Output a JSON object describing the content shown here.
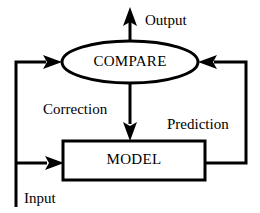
{
  "diagram": {
    "background_color": "#ffffff",
    "stroke_color": "#000000",
    "nodes": [
      {
        "id": "compare",
        "label": "COMPARE",
        "shape": "ellipse",
        "cx": 130,
        "cy": 62,
        "rx": 68,
        "ry": 21
      },
      {
        "id": "model",
        "label": "MODEL",
        "shape": "rectangle",
        "x": 63,
        "y": 141,
        "width": 142,
        "height": 39
      }
    ],
    "edge_labels": [
      {
        "id": "output",
        "text": "Output",
        "x": 145,
        "y": 25
      },
      {
        "id": "correction",
        "text": "Correction",
        "x": 43,
        "y": 114
      },
      {
        "id": "prediction",
        "text": "Prediction",
        "x": 167,
        "y": 129
      },
      {
        "id": "input",
        "text": "Input",
        "x": 24,
        "y": 203
      }
    ],
    "edges": [
      {
        "id": "output-arrow",
        "from": "compare",
        "to": "output",
        "direction": "up"
      },
      {
        "id": "correction-arrow",
        "from": "compare",
        "to": "model",
        "direction": "down"
      },
      {
        "id": "prediction-arrow",
        "from": "model",
        "to": "compare",
        "direction": "right-up-left"
      },
      {
        "id": "feedback-arrow",
        "from": "input-bus",
        "to": "compare",
        "direction": "up-right"
      },
      {
        "id": "input-arrow",
        "from": "input-bus",
        "to": "model",
        "direction": "right"
      }
    ]
  }
}
